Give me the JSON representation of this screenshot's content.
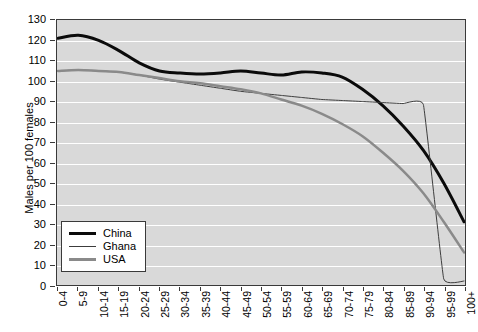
{
  "chart_data": {
    "type": "line",
    "title": "",
    "xlabel": "",
    "ylabel": "Males per 100 females",
    "ylim": [
      0,
      130
    ],
    "ytick_step": 10,
    "yticks": [
      0,
      10,
      20,
      30,
      40,
      50,
      60,
      70,
      80,
      90,
      100,
      110,
      120,
      130
    ],
    "grid": true,
    "grid_color": "#ffffff",
    "plot_background": "#d9d9d9",
    "legend_position": "bottom-left",
    "categories": [
      "0-4",
      "5-9",
      "10-14",
      "15-19",
      "20-24",
      "25-29",
      "30-34",
      "35-39",
      "40-44",
      "45-49",
      "50-54",
      "55-59",
      "60-64",
      "65-69",
      "70-74",
      "75-79",
      "80-84",
      "85-89",
      "90-94",
      "95-99",
      "100+"
    ],
    "series": [
      {
        "name": "China",
        "color": "#0b0b0b",
        "width": 3,
        "values": [
          121,
          122.5,
          120,
          115,
          109,
          105,
          104,
          103.5,
          104,
          105,
          104,
          103,
          104.5,
          104,
          102,
          96,
          88,
          78,
          66,
          50,
          31
        ]
      },
      {
        "name": "Ghana",
        "color": "#3c3c3c",
        "width": 1,
        "values": [
          105,
          105.5,
          105,
          104.5,
          103,
          101,
          99.5,
          98,
          96.5,
          95,
          94,
          93,
          92,
          91,
          90.5,
          90,
          89.5,
          89,
          88.5,
          3,
          2
        ]
      },
      {
        "name": "USA",
        "color": "#8a8a8a",
        "width": 2.5,
        "values": [
          105,
          105.5,
          105,
          104.5,
          103,
          101.5,
          100,
          99,
          97.5,
          96,
          94,
          91,
          88,
          84,
          79,
          73,
          65,
          56,
          45,
          31,
          16
        ]
      }
    ]
  },
  "legend": {
    "items": [
      {
        "label": "China"
      },
      {
        "label": "Ghana"
      },
      {
        "label": "USA"
      }
    ]
  }
}
